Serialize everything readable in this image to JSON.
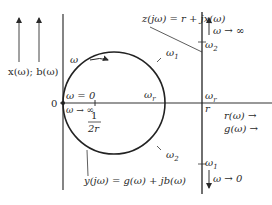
{
  "diagram": {
    "left_axis_label": "x(ω); b(ω)",
    "origin_label": "0",
    "omega_zero_label": "ω = 0",
    "omega_inf_left_label": "ω → ∞",
    "center_label_num": "1",
    "center_label_den": "2r",
    "circle_direction_label": "ω",
    "omega1_circle": "ω",
    "omega1_sub": "1",
    "omega2_circle": "ω",
    "omega2_sub": "2",
    "omega_r_circle": "ω",
    "omega_r_sub": "r",
    "omega_r_line": "ω",
    "omega_r_line_sub": "r",
    "r_label": "r",
    "z_label": "z(jω) = r + jx(ω)",
    "y_label": "y(jω) = g(ω) + jb(ω)",
    "line_omega2": "ω",
    "line_omega2_sub": "2",
    "line_omega1": "ω",
    "line_omega1_sub": "1",
    "omega_inf_top": "ω → ∞",
    "omega_zero_bottom": "ω → 0",
    "r_axis_label": "r(ω) →",
    "g_axis_label": "g(ω) →"
  },
  "colors": {
    "ink": "#2a2a2a"
  }
}
